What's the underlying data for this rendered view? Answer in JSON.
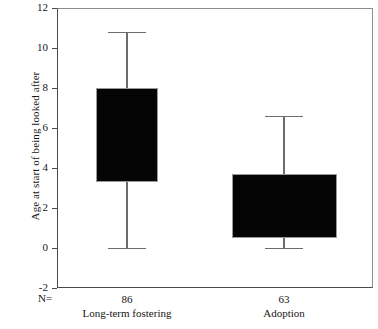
{
  "chart_data": {
    "type": "box",
    "title": "",
    "xlabel": "",
    "ylabel": "Age at start of being looked after",
    "ylim": [
      -2,
      12
    ],
    "yticks": [
      12,
      10,
      8,
      6,
      4,
      2,
      0,
      -2
    ],
    "ytick_labels": [
      "12",
      "10",
      "8",
      "6",
      "4",
      "2",
      "0",
      "-2"
    ],
    "grid": false,
    "legend": "none",
    "n_prefix": "N=",
    "categories": [
      "Long-term fostering",
      "Adoption"
    ],
    "counts": [
      86,
      63
    ],
    "count_labels": [
      "86",
      "63"
    ],
    "boxes": [
      {
        "category": "Long-term fostering",
        "n_label": "86",
        "q1": 3.3,
        "q3": 8.0,
        "whisker_low": 0.0,
        "whisker_high": 10.8,
        "fill": "#050505",
        "line": "#6d6d6d"
      },
      {
        "category": "Adoption",
        "n_label": "63",
        "q1": 0.5,
        "q3": 3.7,
        "whisker_low": 0.0,
        "whisker_high": 6.6,
        "fill": "#050505",
        "line": "#6d6d6d"
      }
    ],
    "axis_color": "#4a4a4a",
    "background": "#ffffff"
  },
  "layout": {
    "plot_left": 57,
    "plot_top": 8,
    "plot_width": 316,
    "plot_height": 280,
    "box1_left": 96,
    "box1_right": 158,
    "box2_left": 232,
    "box2_right": 337,
    "cap_half_width": 19,
    "group1_center": 127,
    "group2_center": 284
  }
}
